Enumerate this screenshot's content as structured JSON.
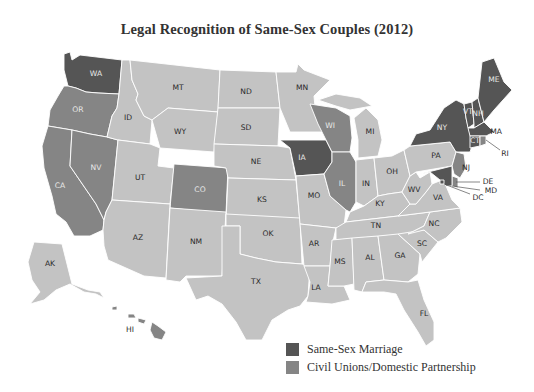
{
  "title": "Legal Recognition of Same-Sex Couples (2012)",
  "colors": {
    "marriage": "#555555",
    "civil_union": "#858585",
    "none": "#c3c3c3",
    "background": "#ffffff",
    "border": "#ffffff"
  },
  "legend": [
    {
      "key": "marriage",
      "label": "Same-Sex Marriage",
      "color": "#555555"
    },
    {
      "key": "civil_union",
      "label": "Civil Unions/Domestic Partnership",
      "color": "#858585"
    }
  ],
  "states": {
    "marriage": [
      "WA",
      "IA",
      "NY",
      "VT",
      "NH",
      "ME",
      "MA",
      "CT",
      "MD",
      "DC"
    ],
    "civil_union": [
      "OR",
      "CA",
      "NV",
      "CO",
      "WI",
      "IL",
      "NJ",
      "DE",
      "RI",
      "HI"
    ],
    "none": [
      "MT",
      "ID",
      "WY",
      "ND",
      "SD",
      "MN",
      "NE",
      "UT",
      "KS",
      "AZ",
      "NM",
      "OK",
      "TX",
      "MO",
      "AR",
      "LA",
      "MS",
      "AL",
      "TN",
      "KY",
      "IN",
      "OH",
      "MI",
      "PA",
      "WV",
      "VA",
      "NC",
      "SC",
      "GA",
      "FL",
      "AK"
    ]
  },
  "labels": {
    "WA": "WA",
    "OR": "OR",
    "CA": "CA",
    "NV": "NV",
    "ID": "ID",
    "MT": "MT",
    "WY": "WY",
    "UT": "UT",
    "CO": "CO",
    "AZ": "AZ",
    "NM": "NM",
    "ND": "ND",
    "SD": "SD",
    "NE": "NE",
    "KS": "KS",
    "OK": "OK",
    "TX": "TX",
    "MN": "MN",
    "IA": "IA",
    "MO": "MO",
    "AR": "AR",
    "LA": "LA",
    "WI": "WI",
    "IL": "IL",
    "MI": "MI",
    "IN": "IN",
    "OH": "OH",
    "KY": "KY",
    "TN": "TN",
    "MS": "MS",
    "AL": "AL",
    "GA": "GA",
    "FL": "FL",
    "SC": "SC",
    "NC": "NC",
    "VA": "VA",
    "WV": "WV",
    "PA": "PA",
    "NY": "NY",
    "VT": "VT",
    "NH": "NH",
    "ME": "ME",
    "MA": "MA",
    "RI": "RI",
    "CT": "CT",
    "NJ": "NJ",
    "DE": "DE",
    "MD": "MD",
    "DC": "DC",
    "AK": "AK",
    "HI": "HI"
  }
}
